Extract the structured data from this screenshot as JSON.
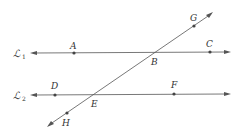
{
  "diagram": {
    "lines": [
      {
        "name": "L1",
        "script_label": "ℒ",
        "subscript": "1",
        "points": [
          "A",
          "B",
          "C"
        ]
      },
      {
        "name": "L2",
        "script_label": "ℒ",
        "subscript": "2",
        "points": [
          "D",
          "E",
          "F"
        ]
      },
      {
        "name": "transversal",
        "points": [
          "H",
          "E",
          "B",
          "G"
        ]
      }
    ],
    "points": {
      "A": {
        "label": "A"
      },
      "B": {
        "label": "B"
      },
      "C": {
        "label": "C"
      },
      "D": {
        "label": "D"
      },
      "E": {
        "label": "E"
      },
      "F": {
        "label": "F"
      },
      "G": {
        "label": "G"
      },
      "H": {
        "label": "H"
      }
    },
    "colors": {
      "line": "#555555",
      "text": "#333333",
      "background": "#ffffff"
    }
  }
}
